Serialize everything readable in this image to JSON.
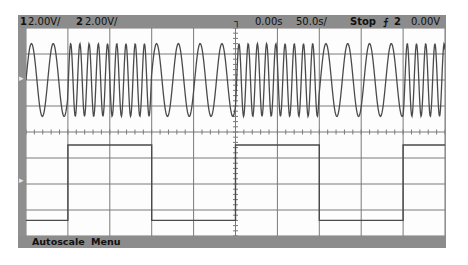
{
  "status_bar": {
    "ch1_num": "1",
    "ch1_scale": "2.00V/",
    "ch2_num": "2",
    "ch2_scale": "2.00V/",
    "trigger_icon": "trigger-edge-icon",
    "time_offset": "0.00s",
    "time_scale": "50.0s/",
    "run_state": "Stop",
    "trigger_slope": "⨍",
    "trigger_source": "2",
    "trigger_level": "0.00V"
  },
  "soft_menu": {
    "autoscale_label": "Autoscale",
    "menu_label": "Menu"
  },
  "channel_markers": {
    "ch1": "1",
    "ch2": "2"
  },
  "colors": {
    "frame": "#8c8c8c",
    "grid": "#7a7a7a",
    "trace": "#4a4a4a",
    "screen_bg": "#fdfdfd"
  },
  "waveforms": {
    "grid": {
      "h_divisions": 10,
      "v_divisions": 8
    },
    "ch1": {
      "type": "fsk_sine",
      "center_y_div": 2.0,
      "amplitude_div": 1.4,
      "slow_period_div": 0.52,
      "fast_period_div": 0.22,
      "segments": [
        {
          "from_div": 0,
          "to_div": 1,
          "freq": "slow"
        },
        {
          "from_div": 1,
          "to_div": 3,
          "freq": "fast"
        },
        {
          "from_div": 3,
          "to_div": 5,
          "freq": "slow"
        },
        {
          "from_div": 5,
          "to_div": 7,
          "freq": "fast"
        },
        {
          "from_div": 7,
          "to_div": 9,
          "freq": "slow"
        },
        {
          "from_div": 9,
          "to_div": 10,
          "freq": "fast"
        }
      ]
    },
    "ch2": {
      "type": "square",
      "high_y_div": 4.5,
      "low_y_div": 7.4,
      "segments": [
        {
          "from_div": 0,
          "to_div": 1,
          "level": "low"
        },
        {
          "from_div": 1,
          "to_div": 3,
          "level": "high"
        },
        {
          "from_div": 3,
          "to_div": 5,
          "level": "low"
        },
        {
          "from_div": 5,
          "to_div": 7,
          "level": "high"
        },
        {
          "from_div": 7,
          "to_div": 9,
          "level": "low"
        },
        {
          "from_div": 9,
          "to_div": 10,
          "level": "high"
        }
      ]
    }
  }
}
